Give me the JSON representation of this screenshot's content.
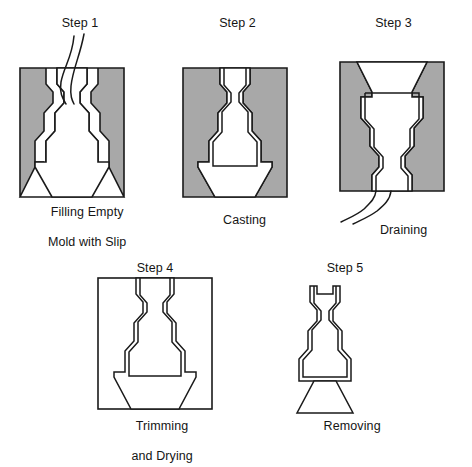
{
  "figure": {
    "kind": "process-diagram",
    "width": 472,
    "height": 449,
    "background_color": "#FFFFFF"
  },
  "colors": {
    "mold_fill": "#A8A8A8",
    "cavity_fill": "#FFFFFF",
    "outline": "#1A1A1A",
    "text": "#151515",
    "page_background": "#FFFFFF"
  },
  "steps": [
    {
      "id": "step-1",
      "title": "Step 1",
      "caption_line_1": "Filling Empty",
      "caption_line_2": "Mold with Slip",
      "mold_filled": true,
      "has_pour_stream": true,
      "has_drain_stream": false,
      "has_cast_wall": false,
      "orientation": "upright"
    },
    {
      "id": "step-2",
      "title": "Step 2",
      "caption_line_1": "Casting",
      "caption_line_2": "",
      "mold_filled": true,
      "has_pour_stream": false,
      "has_drain_stream": false,
      "has_cast_wall": true,
      "orientation": "upright"
    },
    {
      "id": "step-3",
      "title": "Step 3",
      "caption_line_1": "Draining",
      "caption_line_2": "",
      "mold_filled": true,
      "has_pour_stream": false,
      "has_drain_stream": true,
      "has_cast_wall": true,
      "orientation": "inverted"
    },
    {
      "id": "step-4",
      "title": "Step 4",
      "caption_line_1": "Trimming",
      "caption_line_2": "and Drying",
      "mold_filled": false,
      "has_pour_stream": false,
      "has_drain_stream": false,
      "has_cast_wall": true,
      "orientation": "upright"
    },
    {
      "id": "step-5",
      "title": "Step 5",
      "caption_line_1": "Removing",
      "caption_line_2": "",
      "mold_filled": false,
      "has_pour_stream": false,
      "has_drain_stream": false,
      "has_cast_wall": true,
      "orientation": "upright"
    }
  ]
}
